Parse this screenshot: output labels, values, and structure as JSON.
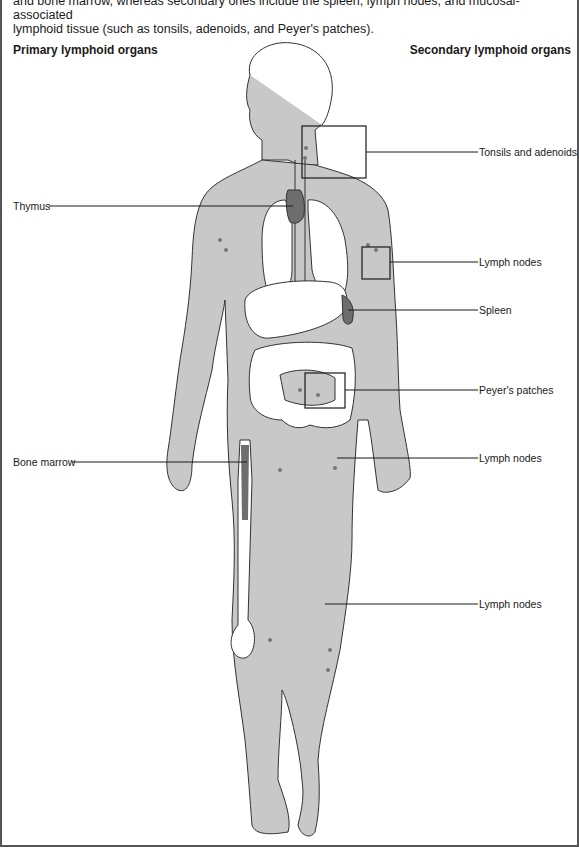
{
  "caption": {
    "line1": "and bone marrow, whereas secondary ones include the spleen, lymph nodes, and mucosal-associated",
    "line2": "lymphoid tissue (such as tonsils, adenoids, and Peyer's patches)."
  },
  "headings": {
    "primary": "Primary lymphoid organs",
    "secondary": "Secondary lymphoid organs"
  },
  "labels": {
    "tonsils": "Tonsils and adenoids",
    "thymus": "Thymus",
    "lymph_arm": "Lymph nodes",
    "spleen": "Spleen",
    "peyers": "Peyer's patches",
    "bone_marrow": "Bone marrow",
    "lymph_groin": "Lymph nodes",
    "lymph_leg": "Lymph nodes"
  },
  "colors": {
    "body_fill": "#c8c8c8",
    "organ_fill": "#ffffff",
    "dark_organ": "#6e6e6e",
    "outline": "#333333",
    "leader_line": "#1a1a1a"
  }
}
